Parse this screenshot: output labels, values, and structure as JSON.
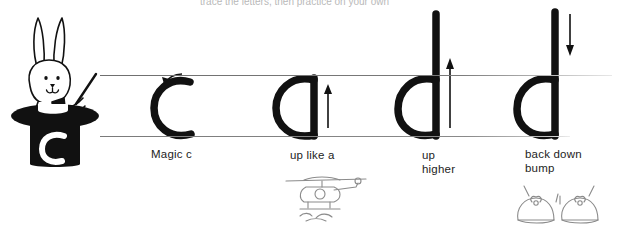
{
  "worksheet": {
    "title": "Magic c letter formation practice row",
    "header_faint_text": "trace the letters, then practice on your own",
    "guides": {
      "midline_label": "midline",
      "baseline_label": "baseline",
      "line_color": "#8d8d8d"
    },
    "mascot": {
      "name": "magician rabbit in top hat",
      "hat_letter": "c",
      "ink_color": "#111111"
    },
    "steps": [
      {
        "letter": "c",
        "caption": "Magic c",
        "arrow": "curve-left-start-arrow",
        "arrow_direction": "counter-clockwise",
        "picture": "none"
      },
      {
        "letter": "a",
        "caption": "up like a",
        "arrow": "up-arrow",
        "arrow_direction": "up",
        "picture": "helicopter"
      },
      {
        "letter": "d",
        "caption": "up\nhigher",
        "arrow": "up-arrow",
        "arrow_direction": "up",
        "picture": "none"
      },
      {
        "letter": "d",
        "caption": "back down\nbump",
        "arrow": "down-arrow",
        "arrow_direction": "down",
        "picture": "shoes"
      }
    ]
  }
}
